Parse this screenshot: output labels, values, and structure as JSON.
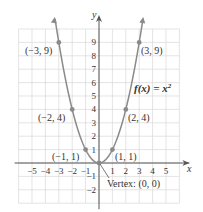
{
  "chart_data": {
    "type": "line",
    "title": "",
    "function_label": "f(x) = x²",
    "xlabel": "x",
    "ylabel": "y",
    "xlim": [
      -6,
      6
    ],
    "ylim": [
      -3,
      10
    ],
    "grid": true,
    "x_ticks": [
      -5,
      -4,
      -3,
      -2,
      -1,
      1,
      2,
      3,
      4,
      5
    ],
    "y_ticks": [
      -2,
      -1,
      1,
      2,
      3,
      4,
      5,
      6,
      7,
      8,
      9
    ],
    "series": [
      {
        "name": "f(x) = x²",
        "x": [
          -3,
          -2,
          -1,
          0,
          1,
          2,
          3
        ],
        "y": [
          9,
          4,
          1,
          0,
          1,
          4,
          9
        ]
      }
    ],
    "points": [
      {
        "x": -3,
        "y": 9,
        "label": "(−3, 9)"
      },
      {
        "x": -2,
        "y": 4,
        "label": "(−2, 4)"
      },
      {
        "x": -1,
        "y": 1,
        "label": "(−1, 1)"
      },
      {
        "x": 0,
        "y": 0,
        "label": "Vertex: (0, 0)"
      },
      {
        "x": 1,
        "y": 1,
        "label": "(1, 1)"
      },
      {
        "x": 2,
        "y": 4,
        "label": "(2, 4)"
      },
      {
        "x": 3,
        "y": 9,
        "label": "(3, 9)"
      }
    ],
    "annotations": [
      "Vertex: (0, 0)",
      "f(x) = x²"
    ],
    "colors": {
      "curve": "#8a8a8a",
      "points": "#8a8a8a",
      "grid": "#d8d8d8",
      "axes": "#555555"
    }
  },
  "labels": {
    "x_axis": "x",
    "y_axis": "y",
    "function": "f(x) = x",
    "function_exp": "2",
    "vertex": "Vertex: (0, 0)",
    "p_m3": "(−3, 9)",
    "p_m2": "(−2, 4)",
    "p_m1": "(−1, 1)",
    "p_1": "(1, 1)",
    "p_2": "(2, 4)",
    "p_3": "(3, 9)"
  }
}
